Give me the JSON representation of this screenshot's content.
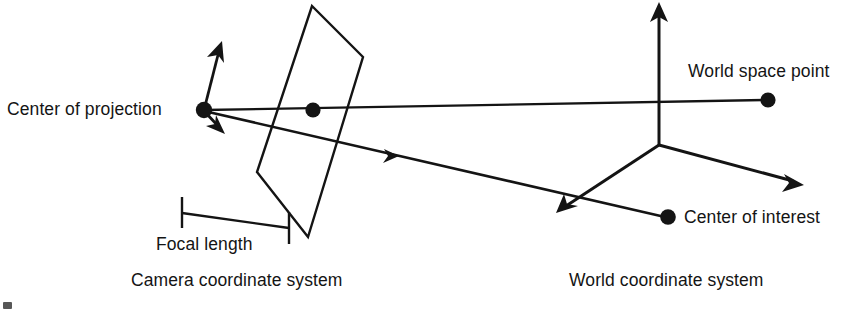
{
  "figure": {
    "kind": "line-diagram",
    "background_color": "#ffffff",
    "ink_color": "#141414",
    "labels": {
      "center_of_projection": "Center of projection",
      "world_space_point": "World space point",
      "center_of_interest": "Center of interest",
      "focal_length": "Focal length",
      "camera_coordinate_system": "Camera coordinate system",
      "world_coordinate_system": "World coordinate system"
    },
    "geometry": {
      "center_of_projection_point": [
        204,
        110
      ],
      "image_plane_point": [
        313,
        110
      ],
      "world_space_point": [
        768,
        100
      ],
      "center_of_interest_point": [
        668,
        218
      ],
      "world_origin": [
        659,
        145
      ],
      "image_plane_quad": [
        [
          312,
          6
        ],
        [
          363,
          57
        ],
        [
          308,
          237
        ],
        [
          257,
          172
        ]
      ],
      "camera_up_axis_tip": [
        222,
        43
      ],
      "camera_down_axis_tip": [
        224,
        133
      ],
      "world_up_axis_tip": [
        659,
        4
      ],
      "world_left_axis_tip": [
        557,
        212
      ],
      "world_right_axis_tip": [
        803,
        185
      ],
      "focal_length_bracket": [
        [
          182,
          198
        ],
        [
          182,
          228
        ],
        [
          289,
          212
        ],
        [
          289,
          243
        ]
      ],
      "ray_direction_marker": [
        393,
        155
      ]
    }
  }
}
